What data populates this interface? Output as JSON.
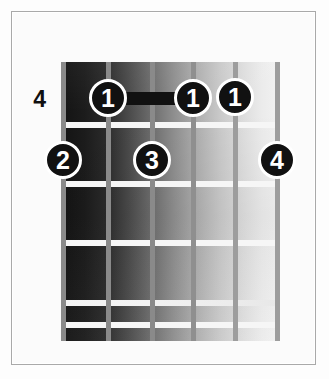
{
  "diagram": {
    "kind": "guitar-chord-diagram",
    "background_color": "#fdfdfd",
    "border_color": "#a9a9a9",
    "starting_fret_label": "4",
    "string_count": 6,
    "fret_count": 5,
    "fretboard": {
      "left": 61,
      "top": 62,
      "width": 218,
      "height": 279,
      "gradient_from": "#131313",
      "gradient_to": "#f2f2f2"
    },
    "strings": [
      {
        "index": 1,
        "name": "string-1-low-e",
        "x": 63,
        "color": "#8a8a8a"
      },
      {
        "index": 2,
        "name": "string-2-a",
        "x": 108,
        "color": "#8a8a8a"
      },
      {
        "index": 3,
        "name": "string-3-d",
        "x": 152,
        "color": "#8a8a8a"
      },
      {
        "index": 4,
        "name": "string-4-g",
        "x": 193,
        "color": "#8f8f8f"
      },
      {
        "index": 5,
        "name": "string-5-b",
        "x": 235,
        "color": "#9d9d9d"
      },
      {
        "index": 6,
        "name": "string-6-high-e",
        "x": 277,
        "color": "#9d9d9d"
      }
    ],
    "fret_lines": [
      {
        "index": 1,
        "y": 122,
        "faint": false
      },
      {
        "index": 2,
        "y": 181,
        "faint": false
      },
      {
        "index": 3,
        "y": 240,
        "faint": false
      },
      {
        "index": 4,
        "y": 300,
        "faint": true
      },
      {
        "index": 5,
        "y": 322,
        "faint": false
      }
    ],
    "barre": {
      "label": "barre-fret-1",
      "from_string": 2,
      "to_string": 4,
      "x": 108,
      "width": 85,
      "y": 92,
      "height": 13,
      "color": "#111111"
    },
    "finger_markers": [
      {
        "finger": "1",
        "string": 2,
        "fret_row": 1,
        "x": 108,
        "y": 98
      },
      {
        "finger": "1",
        "string": 4,
        "fret_row": 1,
        "x": 193,
        "y": 98
      },
      {
        "finger": "1",
        "string": 5,
        "fret_row": 1,
        "x": 235,
        "y": 97
      },
      {
        "finger": "2",
        "string": 1,
        "fret_row": 2,
        "x": 63,
        "y": 160
      },
      {
        "finger": "3",
        "string": 3,
        "fret_row": 2,
        "x": 152,
        "y": 160
      },
      {
        "finger": "4",
        "string": 6,
        "fret_row": 2,
        "x": 277,
        "y": 160
      }
    ],
    "fret_number_marker": {
      "text": "4",
      "x": 18,
      "y": 88
    }
  }
}
